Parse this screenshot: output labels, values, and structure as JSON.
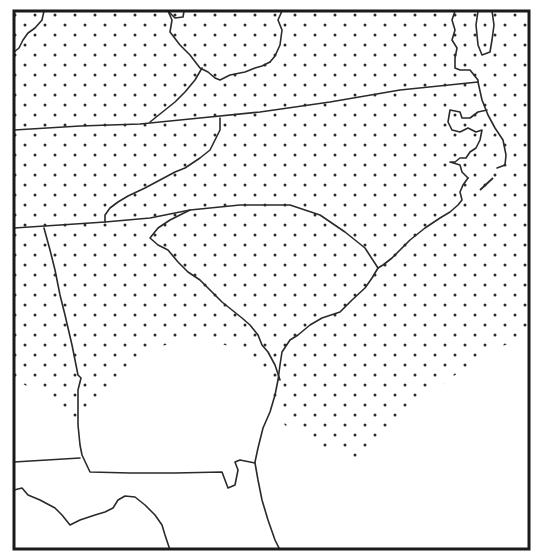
{
  "map": {
    "region": "Southeastern United States",
    "style": "black-and-white line map with stippled shading",
    "colors": {
      "background": "#ffffff",
      "boundary": "#2a2a2a",
      "stipple": "#2b2b2b",
      "frame": "#1a1a1a"
    },
    "layers": [
      {
        "name": "frame",
        "description": "rectangular border"
      },
      {
        "name": "state-boundaries",
        "description": "state lines and coastline"
      },
      {
        "name": "stippled-area",
        "description": "dot-shaded region covering most of map except southern Georgia lowlands, far south, and offshore southeast"
      }
    ],
    "labels": []
  }
}
